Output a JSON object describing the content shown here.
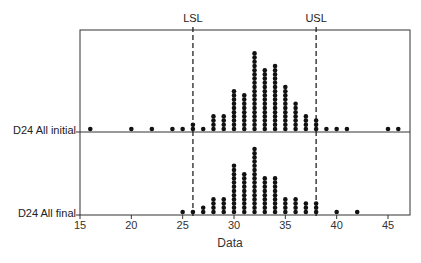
{
  "chart_data": {
    "type": "dotplot",
    "title": "",
    "xlabel": "Data",
    "ylabel": "",
    "xlim": [
      15,
      47
    ],
    "xticks": [
      15,
      20,
      25,
      30,
      35,
      40,
      45
    ],
    "grid": false,
    "spec_limits": [
      {
        "name": "LSL",
        "value": 26
      },
      {
        "name": "USL",
        "value": 38
      }
    ],
    "series": [
      {
        "name": "D24 All initial",
        "points": [
          {
            "x": 16,
            "count": 1
          },
          {
            "x": 20,
            "count": 1
          },
          {
            "x": 22,
            "count": 1
          },
          {
            "x": 24,
            "count": 1
          },
          {
            "x": 25,
            "count": 1
          },
          {
            "x": 26,
            "count": 2
          },
          {
            "x": 27,
            "count": 1
          },
          {
            "x": 28,
            "count": 4
          },
          {
            "x": 29,
            "count": 4
          },
          {
            "x": 30,
            "count": 10
          },
          {
            "x": 31,
            "count": 9
          },
          {
            "x": 32,
            "count": 19
          },
          {
            "x": 33,
            "count": 15
          },
          {
            "x": 34,
            "count": 16
          },
          {
            "x": 35,
            "count": 11
          },
          {
            "x": 36,
            "count": 7
          },
          {
            "x": 37,
            "count": 4
          },
          {
            "x": 38,
            "count": 3
          },
          {
            "x": 39,
            "count": 1
          },
          {
            "x": 40,
            "count": 1
          },
          {
            "x": 41,
            "count": 1
          },
          {
            "x": 45,
            "count": 1
          },
          {
            "x": 46,
            "count": 1
          }
        ]
      },
      {
        "name": "D24 All final",
        "points": [
          {
            "x": 25,
            "count": 1
          },
          {
            "x": 26,
            "count": 1
          },
          {
            "x": 27,
            "count": 2
          },
          {
            "x": 28,
            "count": 4
          },
          {
            "x": 29,
            "count": 4
          },
          {
            "x": 30,
            "count": 12
          },
          {
            "x": 31,
            "count": 10
          },
          {
            "x": 32,
            "count": 16
          },
          {
            "x": 33,
            "count": 9
          },
          {
            "x": 34,
            "count": 9
          },
          {
            "x": 35,
            "count": 4
          },
          {
            "x": 36,
            "count": 4
          },
          {
            "x": 37,
            "count": 3
          },
          {
            "x": 38,
            "count": 3
          },
          {
            "x": 40,
            "count": 1
          },
          {
            "x": 42,
            "count": 1
          }
        ]
      }
    ]
  },
  "labels": {
    "lsl": "LSL",
    "usl": "USL",
    "row_initial": "D24 All initial",
    "row_final": "D24 All final",
    "xlabel": "Data",
    "ticks": [
      "15",
      "20",
      "25",
      "30",
      "35",
      "40",
      "45"
    ]
  },
  "colors": {
    "dot": "#111111",
    "axis": "#333333",
    "spec_line": "#222222"
  }
}
